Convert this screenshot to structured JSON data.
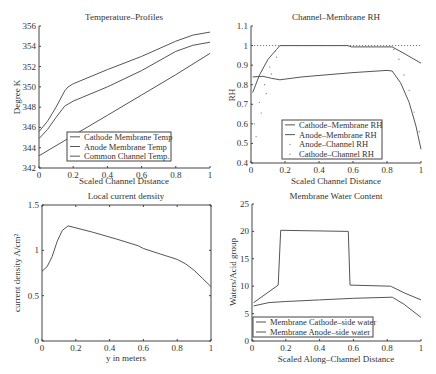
{
  "figure": {
    "width": 436,
    "height": 374,
    "line_color": "#555555",
    "axis_color": "#444444"
  },
  "chart_data": [
    {
      "id": "temperature",
      "type": "line",
      "title": "Temperature–Profiles",
      "xlabel": "Scaled Channel Distance",
      "ylabel": "Degree K",
      "xlim": [
        0,
        1
      ],
      "ylim": [
        342,
        356
      ],
      "xticks": [
        0,
        0.2,
        0.4,
        0.6,
        0.8,
        1
      ],
      "xtick_labels": [
        "0",
        "0.2",
        "0.4",
        "0.6",
        "0.8",
        "1"
      ],
      "yticks": [
        342,
        344,
        346,
        348,
        350,
        352,
        354,
        356
      ],
      "ytick_labels": [
        "342",
        "344",
        "346",
        "348",
        "350",
        "352",
        "354",
        "356"
      ],
      "grid": false,
      "box": false,
      "pixel_box": {
        "x0": 39,
        "x1": 210,
        "y0": 168,
        "y1": 26
      },
      "legend": {
        "x": 67,
        "y": 132,
        "w": 104,
        "h": 29,
        "entries": [
          "Cathode Membrane Temp",
          "Anode Membrane Temp",
          "Common Channel Temp."
        ]
      },
      "series": [
        {
          "name": "Cathode Membrane Temp",
          "style": "line",
          "x": [
            0,
            0.05,
            0.1,
            0.15,
            0.17,
            0.2,
            0.4,
            0.6,
            0.8,
            0.9,
            1
          ],
          "y": [
            345.6,
            346.6,
            348.0,
            349.6,
            350.0,
            350.3,
            351.7,
            353.0,
            354.5,
            355.1,
            355.4
          ]
        },
        {
          "name": "Anode Membrane Temp",
          "style": "line",
          "x": [
            0,
            0.05,
            0.1,
            0.15,
            0.17,
            0.2,
            0.4,
            0.6,
            0.8,
            0.9,
            1
          ],
          "y": [
            344.9,
            345.8,
            347.0,
            348.1,
            348.3,
            348.6,
            350.0,
            351.6,
            353.5,
            354.1,
            354.4
          ]
        },
        {
          "name": "Common Channel Temp.",
          "style": "line",
          "x": [
            0,
            0.2,
            0.4,
            0.6,
            0.8,
            1
          ],
          "y": [
            343.2,
            345.2,
            347.2,
            349.2,
            351.2,
            353.3
          ]
        }
      ]
    },
    {
      "id": "rh",
      "type": "line",
      "title": "Channel–Membrane RH",
      "xlabel": "Scaled Channel Distance",
      "ylabel": "RH",
      "xlim": [
        0,
        1
      ],
      "ylim": [
        0.4,
        1.1
      ],
      "xticks": [
        0,
        0.2,
        0.4,
        0.6,
        0.8,
        1
      ],
      "xtick_labels": [
        "0",
        "0.2",
        "0.4",
        "0.6",
        "0.8",
        "1"
      ],
      "yticks": [
        0.4,
        0.5,
        0.6,
        0.7,
        0.8,
        0.9,
        1.0,
        1.1
      ],
      "ytick_labels": [
        "0.4",
        "0.5",
        "0.6",
        "0.7",
        "0.8",
        "0.9",
        "1",
        "1.1"
      ],
      "grid": false,
      "box": false,
      "reference_line": {
        "y": 1.0,
        "style": "dotted"
      },
      "pixel_box": {
        "x0": 251,
        "x1": 421,
        "y0": 163,
        "y1": 26
      },
      "legend": {
        "x": 282,
        "y": 120,
        "w": 100,
        "h": 39,
        "entries": [
          "Cathode–Membrane RH",
          "Anode–Membrane RH",
          "Anode–Channel RH",
          "Cathode–Channel RH"
        ]
      },
      "series": [
        {
          "name": "Cathode–Membrane RH",
          "style": "line",
          "x": [
            0.01,
            0.05,
            0.1,
            0.15,
            0.17,
            0.57,
            0.59,
            0.83,
            0.9,
            1
          ],
          "y": [
            0.76,
            0.85,
            0.93,
            0.98,
            1.0,
            1.0,
            0.993,
            0.993,
            0.96,
            0.91
          ]
        },
        {
          "name": "Anode–Membrane RH",
          "style": "line",
          "x": [
            0.01,
            0.07,
            0.12,
            0.17,
            0.3,
            0.6,
            0.8,
            0.83,
            0.88,
            0.93,
            0.97,
            1
          ],
          "y": [
            0.84,
            0.843,
            0.833,
            0.825,
            0.84,
            0.862,
            0.873,
            0.87,
            0.81,
            0.71,
            0.59,
            0.47
          ]
        },
        {
          "name": "Anode–Channel RH",
          "style": "dots",
          "x": [
            0.0,
            0.03,
            0.06,
            0.09,
            0.12,
            0.15
          ],
          "y": [
            0.47,
            0.535,
            0.655,
            0.755,
            0.855,
            0.94
          ]
        },
        {
          "name": "Cathode–Channel RH",
          "style": "dots",
          "x": [
            0.02,
            0.05,
            0.08,
            0.11,
            0.14,
            0.84,
            0.87,
            0.9,
            0.93,
            0.96,
            0.99
          ],
          "y": [
            0.6,
            0.71,
            0.8,
            0.89,
            0.97,
            0.98,
            0.93,
            0.85,
            0.77,
            0.66,
            0.56
          ]
        }
      ]
    },
    {
      "id": "current_density",
      "type": "line",
      "title": "Local current density",
      "xlabel": "y in meters",
      "ylabel": "current density A/cm²",
      "xlim": [
        0,
        1
      ],
      "ylim": [
        0,
        1.5
      ],
      "xticks": [
        0,
        0.2,
        0.4,
        0.6,
        0.8,
        1
      ],
      "xtick_labels": [
        "0",
        "0.2",
        "0.4",
        "0.6",
        "0.8",
        "1"
      ],
      "yticks": [
        0,
        0.5,
        1,
        1.5
      ],
      "ytick_labels": [
        "0",
        "0.5",
        "1",
        "1.5"
      ],
      "grid": false,
      "box": true,
      "pixel_box": {
        "x0": 42,
        "x1": 211,
        "y0": 341,
        "y1": 205
      },
      "series": [
        {
          "name": "current density",
          "style": "line",
          "x": [
            0,
            0.03,
            0.06,
            0.09,
            0.12,
            0.155,
            0.3,
            0.45,
            0.57,
            0.6,
            0.7,
            0.8,
            0.85,
            0.9,
            0.95,
            1
          ],
          "y": [
            0.77,
            0.82,
            0.93,
            1.1,
            1.22,
            1.27,
            1.2,
            1.12,
            1.05,
            1.02,
            0.96,
            0.9,
            0.85,
            0.78,
            0.69,
            0.6
          ]
        }
      ]
    },
    {
      "id": "water_content",
      "type": "line",
      "title": "Membrane Water Content",
      "xlabel": "Scaled Along–Channel Distance",
      "ylabel": "Waters/Acid group",
      "xlim": [
        0,
        1
      ],
      "ylim": [
        0,
        25
      ],
      "xticks": [
        0,
        0.2,
        0.4,
        0.6,
        0.8,
        1
      ],
      "xtick_labels": [
        "0",
        "0.2",
        "0.4",
        "0.6",
        "0.8",
        "1"
      ],
      "yticks": [
        0,
        5,
        10,
        15,
        20,
        25
      ],
      "ytick_labels": [
        "0",
        "5",
        "10",
        "15",
        "20",
        "25"
      ],
      "grid": false,
      "box": false,
      "pixel_box": {
        "x0": 252,
        "x1": 421,
        "y0": 341,
        "y1": 204
      },
      "legend": {
        "x": 253,
        "y": 317,
        "w": 120,
        "h": 20,
        "entries": [
          "Membrane Cathode–side water",
          "Membrane Anode–side water"
        ]
      },
      "series": [
        {
          "name": "Membrane Cathode–side water",
          "style": "line",
          "x": [
            0.01,
            0.155,
            0.17,
            0.57,
            0.58,
            0.82,
            0.9,
            1
          ],
          "y": [
            7.0,
            10.2,
            20.2,
            20.0,
            10.2,
            10.0,
            8.8,
            7.5
          ]
        },
        {
          "name": "Membrane Anode–side water",
          "style": "line",
          "x": [
            0.01,
            0.1,
            0.2,
            0.4,
            0.6,
            0.83,
            0.9,
            1
          ],
          "y": [
            6.4,
            7.0,
            7.2,
            7.5,
            7.8,
            8.0,
            6.7,
            4.3
          ]
        }
      ]
    }
  ]
}
